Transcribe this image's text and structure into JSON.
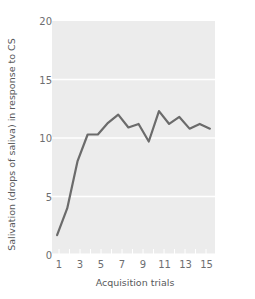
{
  "chart_data": {
    "type": "line",
    "title": "",
    "xlabel": "Acquisition trials",
    "ylabel": "Salivation (drops of saliva) in response to CS",
    "x": [
      1,
      2,
      3,
      4,
      5,
      6,
      7,
      8,
      9,
      10,
      11,
      12,
      13,
      14,
      15,
      16
    ],
    "values": [
      1.7,
      4.0,
      8.0,
      10.3,
      10.3,
      11.3,
      12.0,
      10.9,
      11.2,
      9.7,
      12.3,
      11.2,
      11.8,
      10.8,
      11.2,
      10.8
    ],
    "series": [
      {
        "name": "Salivation",
        "values": [
          1.7,
          4.0,
          8.0,
          10.3,
          10.3,
          11.3,
          12.0,
          10.9,
          11.2,
          9.7,
          12.3,
          11.2,
          11.8,
          10.8,
          11.2,
          10.8
        ]
      }
    ],
    "xlim": [
      0.5,
      16.5
    ],
    "ylim": [
      0,
      20
    ],
    "yticks": [
      0,
      5,
      10,
      15,
      20
    ],
    "ytick_labels": [
      "0",
      "5",
      "10",
      "15",
      "20"
    ],
    "xticks": [
      1,
      3,
      5,
      7,
      9,
      11,
      13,
      15
    ],
    "xtick_labels": [
      "1",
      "3",
      "5",
      "7",
      "9",
      "11",
      "13",
      "15"
    ],
    "grid": true,
    "grid_axis": "y",
    "grid_color": "#ffffff",
    "legend": null,
    "line_color": "#6b6b6b",
    "line_width": 2.2,
    "plot_background": "#ececec",
    "figure_background": "#ffffff",
    "tick_label_color": "#6d6e70",
    "axis_label_color": "#58595b"
  }
}
